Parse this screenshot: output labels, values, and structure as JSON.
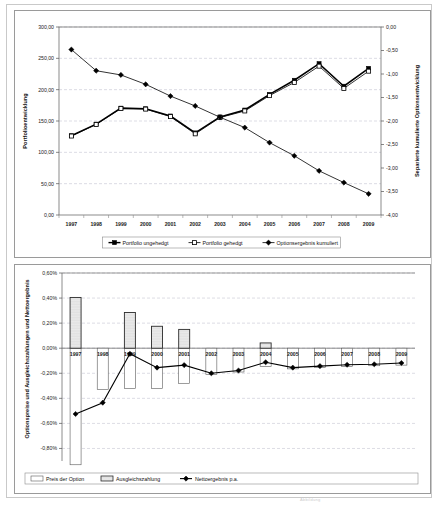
{
  "page": {
    "footnote": "Abbildung"
  },
  "chart_data": [
    {
      "id": "portfolio-chart",
      "type": "line",
      "title": "",
      "xlabel": "",
      "ylabel": "Portfolioentwicklung",
      "y2label": "Separierte kumulierte Optionsentwicklung",
      "grid": true,
      "legend_position": "bottom",
      "categories": [
        "1997",
        "1998",
        "1999",
        "2000",
        "2001",
        "2002",
        "2003",
        "2004",
        "2005",
        "2006",
        "2007",
        "2008",
        "2009"
      ],
      "ylim": [
        0,
        300
      ],
      "yticks": [
        0,
        50,
        100,
        150,
        200,
        250,
        300
      ],
      "ytick_labels": [
        "0,00",
        "50,00",
        "100,00",
        "150,00",
        "200,00",
        "250,00",
        "300,00"
      ],
      "y2lim": [
        -4.0,
        0.0
      ],
      "y2ticks": [
        -4.0,
        -3.5,
        -3.0,
        -2.5,
        -2.0,
        -1.5,
        -1.0,
        -0.5,
        0.0
      ],
      "y2tick_labels": [
        "-4,00",
        "-3,50",
        "-3,00",
        "-2,50",
        "-2,00",
        "-1,50",
        "-1,00",
        "-0,50",
        "0,00"
      ],
      "series": [
        {
          "name": "Portfolio ungehedgt",
          "axis": "left",
          "marker": "filled-square",
          "values": [
            126.5,
            145.0,
            170.5,
            169.5,
            158.0,
            131.0,
            156.5,
            167.5,
            192.5,
            215.0,
            241.5,
            205.5,
            234.0
          ]
        },
        {
          "name": "Portfolio gehedgt",
          "axis": "left",
          "marker": "open-square",
          "values": [
            126.0,
            144.5,
            170.0,
            169.0,
            157.0,
            129.5,
            155.5,
            166.0,
            190.5,
            211.5,
            237.5,
            202.0,
            229.5
          ]
        },
        {
          "name": "Optionsergebnis kumuliert",
          "axis": "right",
          "marker": "filled-diamond",
          "values": [
            -0.48,
            -0.93,
            -1.02,
            -1.22,
            -1.47,
            -1.68,
            -1.92,
            -2.14,
            -2.46,
            -2.74,
            -3.06,
            -3.31,
            -3.55
          ]
        }
      ],
      "legend": [
        "Portfolio ungehedgt",
        "Portfolio gehedgt",
        "Optionsergebnis kumuliert"
      ]
    },
    {
      "id": "option-cost-chart",
      "type": "bar",
      "title": "",
      "xlabel": "",
      "ylabel": "Optionspreise und Ausgleichszahlungen und Nettoergebnis",
      "grid": true,
      "legend_position": "bottom",
      "categories": [
        "1997",
        "1998",
        "1999",
        "2000",
        "2001",
        "2002",
        "2003",
        "2004",
        "2005",
        "2006",
        "2007",
        "2008",
        "2009"
      ],
      "ylim": [
        -0.9,
        0.6
      ],
      "yticks": [
        0.6,
        0.4,
        0.2,
        0.0,
        -0.2,
        -0.4,
        -0.6,
        -0.8
      ],
      "ytick_labels": [
        "0,60%",
        "0,40%",
        "0,20%",
        "0,00%",
        "-0,20%",
        "-0,40%",
        "-0,60%",
        "-0,80%"
      ],
      "series": [
        {
          "name": "Preis der Option",
          "fill": "white",
          "values": [
            -0.93,
            -0.33,
            -0.32,
            -0.32,
            -0.28,
            -0.21,
            -0.19,
            -0.145,
            -0.165,
            -0.155,
            -0.145,
            -0.14,
            -0.135
          ]
        },
        {
          "name": "Ausgleichszahlung",
          "fill": "dotted",
          "values": [
            0.405,
            0.0,
            0.285,
            0.175,
            0.15,
            0.0,
            0.0,
            0.042,
            0.0,
            0.0,
            0.0,
            0.0,
            0.0
          ]
        },
        {
          "name": "Nettoergebnis p.a.",
          "marker": "filled-diamond",
          "type": "line",
          "values": [
            -0.525,
            -0.435,
            -0.045,
            -0.155,
            -0.135,
            -0.2,
            -0.178,
            -0.112,
            -0.155,
            -0.143,
            -0.132,
            -0.128,
            -0.118
          ]
        }
      ],
      "legend": [
        "Preis der Option",
        "Ausgleichszahlung",
        "Nettoergebnis p.a."
      ]
    }
  ]
}
